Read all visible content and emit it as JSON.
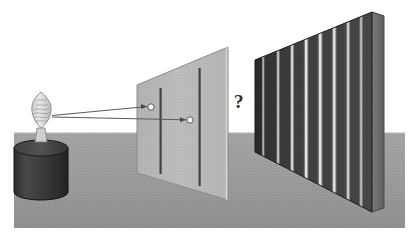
{
  "figure": {
    "background_color": "#ffffff",
    "width": 413,
    "height": 245
  },
  "ground": {
    "name": "ground-plane",
    "color": "#9a9a9a",
    "shade_color": "#8e8e8e",
    "horizon_y": 133,
    "left": 14,
    "right": 405,
    "bottom": 228
  },
  "source": {
    "name": "light-source",
    "label": "",
    "flame": {
      "color": "#d8d8d8",
      "outline": "#6f6f6f",
      "center_x": 40,
      "center_y": 108,
      "width": 20,
      "height": 34
    },
    "base": {
      "name": "cylinder-base",
      "top_color": "#4a4a4a",
      "body_color": "#3a3a3a",
      "edge_color": "#202020",
      "center_x": 41,
      "top_y": 140,
      "bottom_y": 200,
      "radius_x": 27,
      "radius_y": 8
    }
  },
  "rays": {
    "name": "light-rays",
    "color": "#555555",
    "count": 2,
    "items": [
      {
        "label": "ray-to-upper-slit",
        "x1": 52,
        "y1": 116,
        "x2": 152,
        "y2": 107
      },
      {
        "label": "ray-to-lower-slit",
        "x1": 52,
        "y1": 117,
        "x2": 190,
        "y2": 120
      }
    ]
  },
  "barrier": {
    "name": "double-slit-barrier",
    "fill_color": "#b9b9b9",
    "edge_color": "#7d7d7d",
    "corners": {
      "top_left_x": 137,
      "top_left_y": 85,
      "top_right_x": 228,
      "top_right_y": 47,
      "bottom_right_x": 228,
      "bottom_right_y": 200,
      "bottom_left_x": 137,
      "bottom_left_y": 173
    },
    "slits": [
      {
        "name": "slit-left",
        "color": "#3f3f3f",
        "x": 160,
        "y_top": 90,
        "y_bottom": 172,
        "width": 2
      },
      {
        "name": "slit-right",
        "color": "#3f3f3f",
        "x": 199,
        "y_top": 70,
        "y_bottom": 185,
        "width": 2
      }
    ],
    "apertures": [
      {
        "name": "aperture-upper",
        "cx": 151,
        "cy": 107,
        "r": 3,
        "fill": "#f2f2f2",
        "stroke": "#555555"
      },
      {
        "name": "aperture-lower",
        "cx": 190,
        "cy": 120,
        "r": 3,
        "fill": "#f2f2f2",
        "stroke": "#555555"
      }
    ]
  },
  "question_mark": {
    "name": "question-mark",
    "text": "?",
    "x": 236,
    "y": 96,
    "color": "#2c2c2c"
  },
  "detection_screen": {
    "name": "detection-screen",
    "base_color": "#3d3d3d",
    "dark_color": "#303030",
    "edge_color": "#1d1d1d",
    "corners": {
      "top_left_x": 255,
      "top_left_y": 60,
      "top_right_x": 372,
      "top_right_y": 12,
      "bottom_right_x": 372,
      "bottom_right_y": 212,
      "bottom_left_x": 255,
      "bottom_left_y": 152
    },
    "side_face": {
      "name": "screen-side-face",
      "color": "#6e6e6e",
      "depth_x": 384,
      "depth_y_top": 14,
      "depth_y_bottom": 206
    },
    "fringes": {
      "name": "interference-fringes",
      "color": "#dcdcdc",
      "count": 8,
      "positions": [
        263,
        278,
        292,
        306,
        320,
        334,
        348,
        361
      ],
      "widths": [
        2.0,
        2.4,
        2.6,
        2.8,
        3.0,
        3.0,
        3.0,
        2.6
      ],
      "intensities": [
        0.55,
        0.7,
        0.82,
        0.95,
        0.95,
        0.88,
        0.78,
        0.62
      ]
    }
  }
}
